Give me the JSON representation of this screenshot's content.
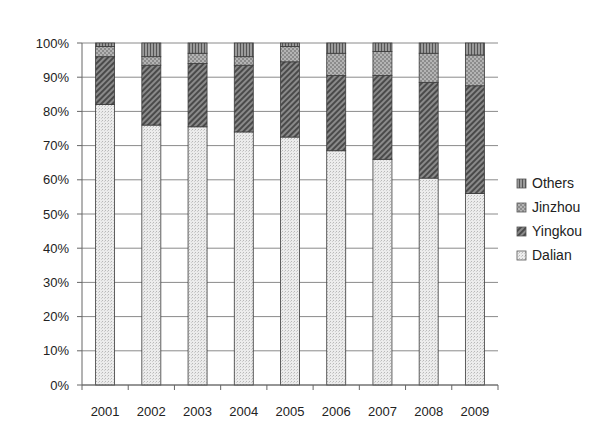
{
  "chart_data": {
    "type": "bar",
    "stacked": true,
    "percent": true,
    "title": "",
    "xlabel": "",
    "ylabel": "",
    "ylim": [
      0,
      100
    ],
    "yticks": [
      "0%",
      "10%",
      "20%",
      "30%",
      "40%",
      "50%",
      "60%",
      "70%",
      "80%",
      "90%",
      "100%"
    ],
    "grid": true,
    "legend_position": "right",
    "categories": [
      "2001",
      "2002",
      "2003",
      "2004",
      "2005",
      "2006",
      "2007",
      "2008",
      "2009"
    ],
    "series": [
      {
        "name": "Dalian",
        "pattern": "dots-light",
        "values": [
          82,
          76,
          75.5,
          74,
          72.5,
          68.5,
          66,
          60.5,
          56
        ]
      },
      {
        "name": "Yingkou",
        "pattern": "hatch-dark",
        "values": [
          14,
          17.5,
          18.5,
          19.5,
          22,
          22,
          24.5,
          28,
          31.5
        ]
      },
      {
        "name": "Jinzhou",
        "pattern": "checker-mid",
        "values": [
          3,
          2.5,
          3,
          2.5,
          4.5,
          6.5,
          7,
          8.5,
          9
        ]
      },
      {
        "name": "Others",
        "pattern": "vertical-dark",
        "values": [
          1,
          4,
          3,
          4,
          1,
          3,
          2.5,
          3,
          3.5
        ]
      }
    ],
    "legend": [
      "Others",
      "Jinzhou",
      "Yingkou",
      "Dalian"
    ]
  }
}
